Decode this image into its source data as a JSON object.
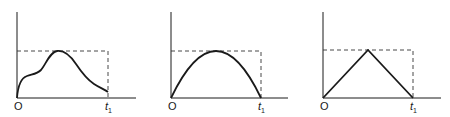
{
  "panels": [
    {
      "id": "panel-1",
      "shape": "irregular-hump",
      "origin_label": "O",
      "end_label": "t",
      "end_label_sub": "1"
    },
    {
      "id": "panel-2",
      "shape": "parabola",
      "origin_label": "O",
      "end_label": "t",
      "end_label_sub": "1"
    },
    {
      "id": "panel-3",
      "shape": "triangle",
      "origin_label": "O",
      "end_label": "t",
      "end_label_sub": "1"
    }
  ],
  "colors": {
    "stroke": "#1a1a1a",
    "dashed": "#333333",
    "background": "#ffffff"
  }
}
